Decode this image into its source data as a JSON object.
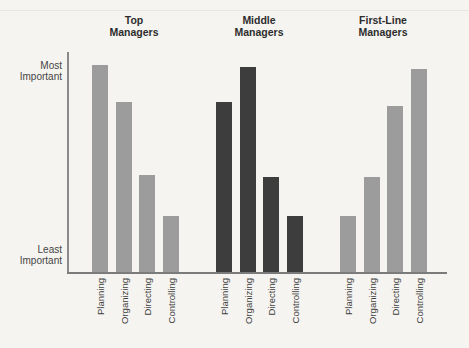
{
  "figure": {
    "background": "#f5f4f0",
    "gray_bar_color": "#9c9c9c",
    "dark_bar_color": "#3d3d3d",
    "axis_color": "#8a8a8a"
  },
  "y_axis": {
    "most": [
      "Most",
      "Important"
    ],
    "least": [
      "Least",
      "Important"
    ]
  },
  "chart_data": {
    "type": "bar",
    "title": "",
    "xlabel": "",
    "ylabel": "",
    "y_axis_annotations": [
      "Most Important",
      "Least Important"
    ],
    "value_scale": "relative importance, 0 = least, 100 = most",
    "ylim": [
      0,
      100
    ],
    "grid": false,
    "legend": false,
    "categories": [
      "Planning",
      "Organizing",
      "Directing",
      "Controlling"
    ],
    "series": [
      {
        "name": "Top Managers",
        "title_lines": [
          "Top",
          "Managers"
        ],
        "color": "#9c9c9c",
        "values": [
          100,
          82,
          47,
          27
        ]
      },
      {
        "name": "Middle Managers",
        "title_lines": [
          "Middle",
          "Managers"
        ],
        "color": "#3d3d3d",
        "values": [
          82,
          99,
          46,
          27
        ]
      },
      {
        "name": "First-Line Managers",
        "title_lines": [
          "First-Line",
          "Managers"
        ],
        "color": "#9c9c9c",
        "values": [
          27,
          46,
          80,
          98
        ]
      }
    ]
  }
}
